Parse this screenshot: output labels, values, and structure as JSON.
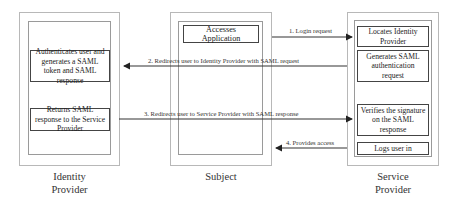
{
  "actors": {
    "identity_provider": {
      "name_line1": "Identity",
      "name_line2": "Provider",
      "steps": [
        "Authenticates user and generates a SAML token and SAML response",
        "Returns SAML response to the Service Provider"
      ]
    },
    "subject": {
      "name": "Subject",
      "steps": [
        "Accesses Application"
      ]
    },
    "service_provider": {
      "name_line1": "Service",
      "name_line2": "Provider",
      "steps": [
        "Locates Identity Provider",
        "Generates SAML authentication request",
        "Verifies the signature on the SAML response",
        "Logs user in"
      ]
    }
  },
  "messages": [
    {
      "label": "1. Login request",
      "from": "Subject",
      "to": "Service Provider"
    },
    {
      "label": "2. Redirects user to Identity Provider with SAML request",
      "from": "Service Provider",
      "to": "Identity Provider"
    },
    {
      "label": "3. Redirects user to Service Provider with SAML response",
      "from": "Identity Provider",
      "to": "Service Provider"
    },
    {
      "label": "4. Provides access",
      "from": "Service Provider",
      "to": "Subject"
    }
  ],
  "colors": {
    "line": "#333333",
    "box_border": "#444444",
    "outer_border": "#b8b8b8"
  }
}
